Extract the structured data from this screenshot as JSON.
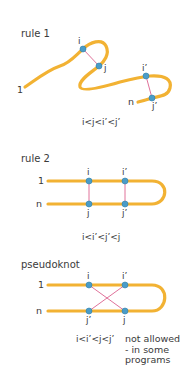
{
  "colors": {
    "strand": "#f2b233",
    "base": "#4a9cc8",
    "base_stroke": "#2f7fa8",
    "pair": "#e0729a",
    "text": "#3a3a3a"
  },
  "panels": {
    "rule1": {
      "title": "rule 1",
      "end_start": "1",
      "end_stop": "n",
      "bases": {
        "i": "i",
        "j": "j",
        "i_prime": "i’",
        "j_prime": "j’"
      },
      "condition": "i<j<i’<j’"
    },
    "rule2": {
      "title": "rule 2",
      "end_start": "1",
      "end_stop": "n",
      "bases": {
        "i": "i",
        "j": "j",
        "i_prime": "i’",
        "j_prime": "j’"
      },
      "condition": "i<i’<j’<j"
    },
    "pseudoknot": {
      "title": "pseudoknot",
      "end_start": "1",
      "end_stop": "n",
      "bases": {
        "i": "i",
        "j": "j",
        "i_prime": "i’",
        "j_prime": "j’"
      },
      "condition": "i<i’<j<j’",
      "note": "not allowed - in some programs"
    }
  }
}
